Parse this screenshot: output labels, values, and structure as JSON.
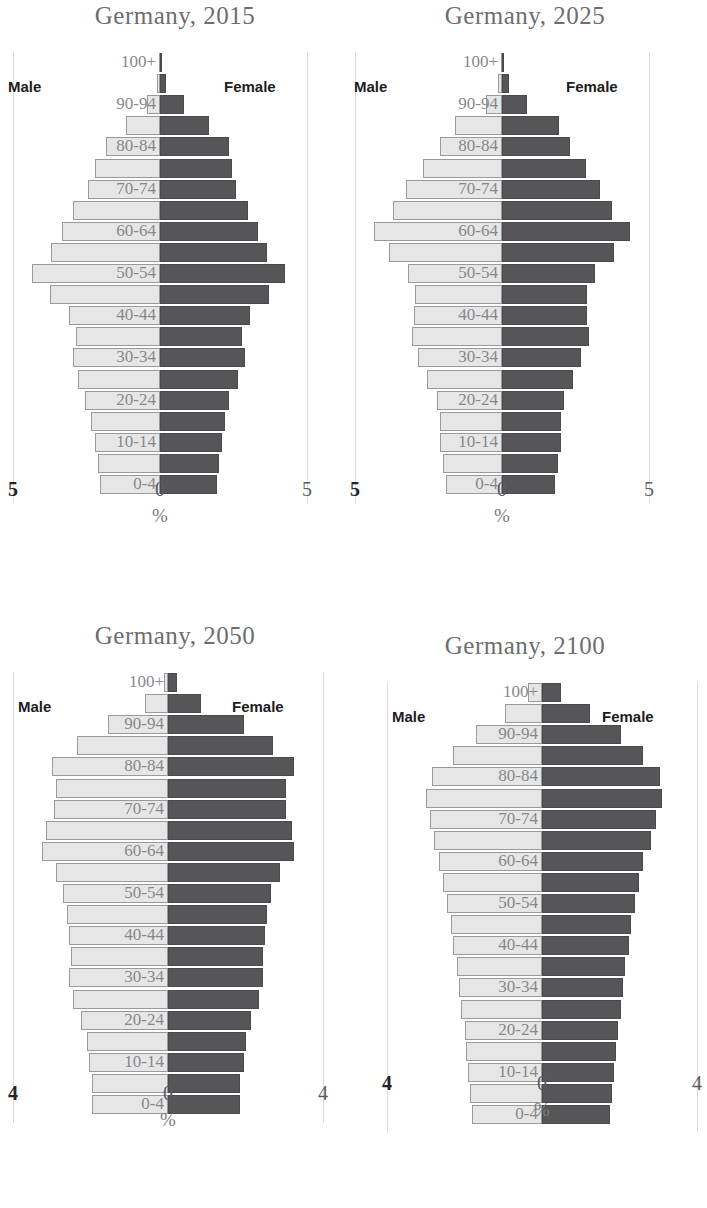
{
  "figure": {
    "series_names": {
      "male": "Male",
      "female": "Female"
    },
    "axis_unit": "%"
  },
  "chart_data": [
    {
      "type": "bar",
      "orientation": "horizontal",
      "subtype": "population-pyramid",
      "title": "Germany, 2015",
      "xlabel": "%",
      "ylabel": "",
      "xlim": [
        -5,
        5
      ],
      "xticks": [
        "5",
        "0",
        "5"
      ],
      "grid": false,
      "legend_position": "inside-top",
      "categories": [
        "0-4",
        "5-9",
        "10-14",
        "15-19",
        "20-24",
        "25-29",
        "30-34",
        "35-39",
        "40-44",
        "45-49",
        "50-54",
        "55-59",
        "60-64",
        "65-69",
        "70-74",
        "75-79",
        "80-84",
        "85-89",
        "90-94",
        "95-99",
        "100+"
      ],
      "axis_labels_shown": [
        "0-4",
        "10-14",
        "20-24",
        "30-34",
        "40-44",
        "50-54",
        "60-64",
        "70-74",
        "80-84",
        "90-94",
        "100+"
      ],
      "series": [
        {
          "name": "Male",
          "values": [
            2.05,
            2.1,
            2.2,
            2.35,
            2.55,
            2.8,
            2.95,
            2.85,
            3.1,
            3.75,
            4.35,
            3.7,
            3.35,
            2.95,
            2.45,
            2.2,
            1.85,
            1.15,
            0.45,
            0.1,
            0.02
          ]
        },
        {
          "name": "Female",
          "values": [
            1.95,
            2.0,
            2.1,
            2.2,
            2.35,
            2.65,
            2.9,
            2.8,
            3.05,
            3.7,
            4.25,
            3.65,
            3.35,
            3.0,
            2.6,
            2.45,
            2.35,
            1.65,
            0.8,
            0.22,
            0.05
          ]
        }
      ]
    },
    {
      "type": "bar",
      "orientation": "horizontal",
      "subtype": "population-pyramid",
      "title": "Germany, 2025",
      "xlabel": "%",
      "ylabel": "",
      "xlim": [
        -5,
        5
      ],
      "xticks": [
        "5",
        "0",
        "5"
      ],
      "grid": false,
      "legend_position": "inside-top",
      "categories": [
        "0-4",
        "5-9",
        "10-14",
        "15-19",
        "20-24",
        "25-29",
        "30-34",
        "35-39",
        "40-44",
        "45-49",
        "50-54",
        "55-59",
        "60-64",
        "65-69",
        "70-74",
        "75-79",
        "80-84",
        "85-89",
        "90-94",
        "95-99",
        "100+"
      ],
      "axis_labels_shown": [
        "0-4",
        "10-14",
        "20-24",
        "30-34",
        "40-44",
        "50-54",
        "60-64",
        "70-74",
        "80-84",
        "90-94",
        "100+"
      ],
      "series": [
        {
          "name": "Male",
          "values": [
            1.9,
            2.0,
            2.1,
            2.1,
            2.2,
            2.55,
            2.85,
            3.05,
            3.0,
            2.95,
            3.2,
            3.85,
            4.35,
            3.7,
            3.25,
            2.7,
            2.1,
            1.6,
            0.55,
            0.12,
            0.03
          ]
        },
        {
          "name": "Female",
          "values": [
            1.8,
            1.9,
            2.0,
            2.0,
            2.1,
            2.4,
            2.7,
            2.95,
            2.9,
            2.9,
            3.15,
            3.8,
            4.35,
            3.75,
            3.35,
            2.85,
            2.3,
            1.95,
            0.85,
            0.25,
            0.06
          ]
        }
      ]
    },
    {
      "type": "bar",
      "orientation": "horizontal",
      "subtype": "population-pyramid",
      "title": "Germany, 2050",
      "xlabel": "%",
      "ylabel": "",
      "xlim": [
        -4,
        4
      ],
      "xticks": [
        "4",
        "0",
        "4"
      ],
      "grid": false,
      "legend_position": "inside-top",
      "categories": [
        "0-4",
        "5-9",
        "10-14",
        "15-19",
        "20-24",
        "25-29",
        "30-34",
        "35-39",
        "40-44",
        "45-49",
        "50-54",
        "55-59",
        "60-64",
        "65-69",
        "70-74",
        "75-79",
        "80-84",
        "85-89",
        "90-94",
        "95-99",
        "100+"
      ],
      "axis_labels_shown": [
        "0-4",
        "10-14",
        "20-24",
        "30-34",
        "40-44",
        "50-54",
        "60-64",
        "70-74",
        "80-84",
        "90-94",
        "100+"
      ],
      "series": [
        {
          "name": "Male",
          "values": [
            1.95,
            1.95,
            2.05,
            2.1,
            2.25,
            2.45,
            2.55,
            2.5,
            2.55,
            2.6,
            2.7,
            2.9,
            3.25,
            3.15,
            2.95,
            2.9,
            3.0,
            2.35,
            1.55,
            0.6,
            0.1
          ]
        },
        {
          "name": "Female",
          "values": [
            1.85,
            1.85,
            1.95,
            2.0,
            2.15,
            2.35,
            2.45,
            2.45,
            2.5,
            2.55,
            2.65,
            2.9,
            3.25,
            3.2,
            3.05,
            3.05,
            3.25,
            2.7,
            1.95,
            0.85,
            0.22
          ]
        }
      ]
    },
    {
      "type": "bar",
      "orientation": "horizontal",
      "subtype": "population-pyramid",
      "title": "Germany, 2100",
      "xlabel": "%",
      "ylabel": "",
      "xlim": [
        -4,
        4
      ],
      "xticks": [
        "4",
        "0",
        "4"
      ],
      "grid": false,
      "legend_position": "inside-top",
      "categories": [
        "0-4",
        "5-9",
        "10-14",
        "15-19",
        "20-24",
        "25-29",
        "30-34",
        "35-39",
        "40-44",
        "45-49",
        "50-54",
        "55-59",
        "60-64",
        "65-69",
        "70-74",
        "75-79",
        "80-84",
        "85-89",
        "90-94",
        "95-99",
        "100+"
      ],
      "axis_labels_shown": [
        "0-4",
        "10-14",
        "20-24",
        "30-34",
        "40-44",
        "50-54",
        "60-64",
        "70-74",
        "80-84",
        "90-94",
        "100+"
      ],
      "series": [
        {
          "name": "Male",
          "values": [
            1.8,
            1.85,
            1.9,
            1.95,
            2.0,
            2.1,
            2.15,
            2.2,
            2.3,
            2.35,
            2.45,
            2.55,
            2.65,
            2.8,
            2.9,
            3.0,
            2.85,
            2.3,
            1.7,
            0.95,
            0.35
          ]
        },
        {
          "name": "Female",
          "values": [
            1.75,
            1.8,
            1.85,
            1.9,
            1.95,
            2.05,
            2.1,
            2.15,
            2.25,
            2.3,
            2.4,
            2.5,
            2.6,
            2.8,
            2.95,
            3.1,
            3.05,
            2.6,
            2.05,
            1.25,
            0.5
          ]
        }
      ]
    }
  ],
  "colors": {
    "male_bar": "#e6e6e6",
    "male_bar_border": "#9a9a9c",
    "female_bar": "#565658",
    "title_text": "#6d6d6f",
    "age_label_text": "#88888a",
    "gender_label_text": "#1d1d1f"
  }
}
